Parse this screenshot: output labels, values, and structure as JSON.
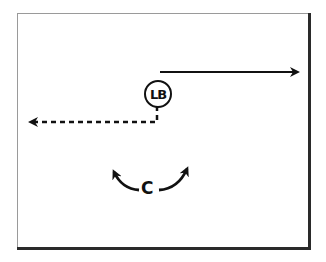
{
  "diagram": {
    "type": "football-play-diagram",
    "players": [
      {
        "label": "LB",
        "shape": "circle",
        "x": 157,
        "y": 93
      },
      {
        "label": "C",
        "shape": "text",
        "x": 148,
        "y": 190
      }
    ],
    "routes": [
      {
        "from": "LB",
        "style": "solid",
        "direction": "right",
        "description": "solid arrow to the right"
      },
      {
        "from": "LB",
        "style": "dashed",
        "direction": "down-then-left",
        "description": "dashed line down then left with arrowhead"
      }
    ],
    "movements": [
      {
        "from": "C",
        "style": "curved",
        "direction": "up-left"
      },
      {
        "from": "C",
        "style": "curved",
        "direction": "up-right"
      }
    ],
    "colors": {
      "ink": "#111111",
      "frame_light": "#9a9a9a",
      "frame_dark": "#2a2a2a",
      "background": "#ffffff"
    }
  }
}
